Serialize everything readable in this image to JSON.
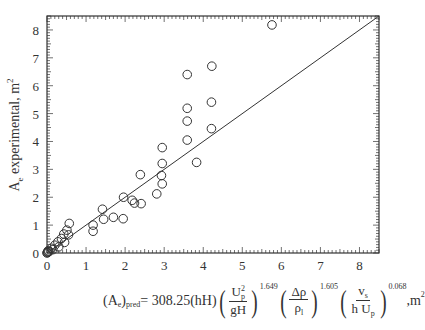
{
  "chart_data": {
    "type": "scatter",
    "title": "",
    "xlabel": "(A_e)_pred = 308.25(hH)(U_p^2/gH)^1.649 (Δρ/ρ_l)^1.605 (v_s/hU_p)^0.068 , m^2",
    "ylabel": "A_e experimental, m^2",
    "xlim": [
      0,
      8.5
    ],
    "ylim": [
      0,
      8.5
    ],
    "x_ticks": [
      0,
      1,
      2,
      3,
      4,
      5,
      6,
      7,
      8
    ],
    "y_ticks": [
      0,
      1,
      2,
      3,
      4,
      5,
      6,
      7,
      8
    ],
    "grid": false,
    "legend": null,
    "series": [
      {
        "name": "Experimental data",
        "marker": "open-circle",
        "points": [
          [
            0.0,
            0.0
          ],
          [
            0.01,
            0.02
          ],
          [
            0.02,
            0.04
          ],
          [
            0.03,
            0.08
          ],
          [
            0.05,
            0.05
          ],
          [
            0.11,
            0.17
          ],
          [
            0.15,
            0.12
          ],
          [
            0.2,
            0.28
          ],
          [
            0.28,
            0.4
          ],
          [
            0.3,
            0.22
          ],
          [
            0.37,
            0.52
          ],
          [
            0.43,
            0.68
          ],
          [
            0.45,
            0.38
          ],
          [
            0.51,
            0.82
          ],
          [
            0.57,
            1.06
          ],
          [
            0.55,
            0.65
          ],
          [
            1.18,
            1.0
          ],
          [
            1.18,
            0.78
          ],
          [
            1.42,
            1.57
          ],
          [
            1.45,
            1.21
          ],
          [
            1.7,
            1.28
          ],
          [
            1.95,
            1.23
          ],
          [
            1.96,
            2.0
          ],
          [
            2.18,
            1.89
          ],
          [
            2.24,
            1.79
          ],
          [
            2.39,
            2.81
          ],
          [
            2.41,
            1.77
          ],
          [
            2.81,
            2.12
          ],
          [
            2.93,
            2.78
          ],
          [
            2.95,
            2.48
          ],
          [
            2.95,
            3.21
          ],
          [
            2.95,
            3.78
          ],
          [
            3.59,
            4.05
          ],
          [
            3.59,
            4.73
          ],
          [
            3.59,
            5.19
          ],
          [
            3.59,
            6.4
          ],
          [
            3.83,
            3.25
          ],
          [
            4.21,
            4.46
          ],
          [
            4.21,
            5.41
          ],
          [
            4.22,
            6.7
          ],
          [
            5.76,
            8.18
          ]
        ]
      },
      {
        "name": "Parity line",
        "type": "line",
        "points": [
          [
            0,
            0
          ],
          [
            8.5,
            8.5
          ]
        ]
      }
    ]
  },
  "axes": {
    "y_title_main": "A",
    "y_title_sub": "e",
    "y_title_rest": " experimental, m",
    "y_title_sup": "2"
  },
  "formula": {
    "lhs_open": "(A",
    "lhs_sub_e": "e",
    "lhs_close": ")",
    "lhs_sub_pred": "pred",
    "equals": " = 308.25(hH)",
    "f1_num": "U",
    "f1_num_sub": "p",
    "f1_num_sup": "2",
    "f1_den": "gH",
    "f1_exp": "1.649",
    "f2_num": "Δρ",
    "f2_den": "ρ",
    "f2_den_sub": "l",
    "f2_exp": "1.605",
    "f3_num": "v",
    "f3_num_sub": "s",
    "f3_den": "h U",
    "f3_den_sub": "p",
    "f3_exp": "0.068",
    "unit": " ,m",
    "unit_sup": "2"
  }
}
